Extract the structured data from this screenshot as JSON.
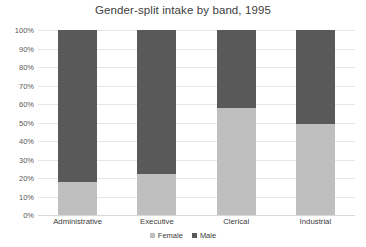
{
  "chart_data": {
    "type": "bar",
    "subtype": "stacked-100-percent",
    "title": "Gender-split intake by band, 1995",
    "xlabel": "",
    "ylabel": "",
    "categories": [
      "Administrative",
      "Executive",
      "Clerical",
      "Industrial"
    ],
    "series": [
      {
        "name": "Female",
        "values": [
          18,
          22,
          58,
          49
        ],
        "color": "#BFBFBF"
      },
      {
        "name": "Male",
        "values": [
          82,
          78,
          42,
          51
        ],
        "color": "#595959"
      }
    ],
    "ylim": [
      0,
      100
    ],
    "ytick_labels": [
      "0%",
      "10%",
      "20%",
      "30%",
      "40%",
      "50%",
      "60%",
      "70%",
      "80%",
      "90%",
      "100%"
    ],
    "ytick_values": [
      0,
      10,
      20,
      30,
      40,
      50,
      60,
      70,
      80,
      90,
      100
    ],
    "grid": "horizontal",
    "legend_position": "bottom",
    "value_suffix": "%"
  },
  "colors": {
    "female": "#BFBFBF",
    "male": "#595959",
    "gridline": "#E6E6E6",
    "baseline": "#D9D9D9",
    "text": "#404040",
    "axis_text": "#595959",
    "background": "#FFFFFF"
  }
}
